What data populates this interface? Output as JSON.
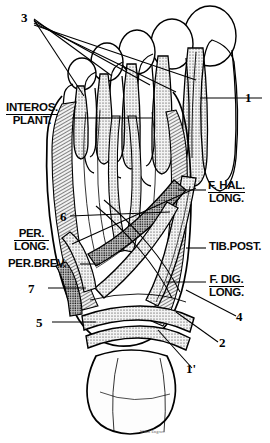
{
  "figure": {
    "view": "plantar",
    "signature": "Wood Engrav."
  },
  "labels": {
    "interosseous_plantar": {
      "line1": "INTEROS.",
      "line2": "PLANT."
    },
    "peroneus_longus": {
      "line1": "PER.",
      "line2": "LONG."
    },
    "peroneus_brevis": {
      "text": "PER.BREV."
    },
    "flexor_hallucis_longus": {
      "line1": "F. HAL.",
      "line2": "LONG."
    },
    "tibialis_posterior": {
      "text": "TIB.POST."
    },
    "flexor_digitorum_longus": {
      "line1": "F. DIG.",
      "line2": "LONG."
    }
  },
  "numbers": {
    "n1": "1",
    "n1prime": "1'",
    "n2": "2",
    "n3": "3",
    "n4": "4",
    "n5": "5",
    "n6": "6",
    "n7": "7"
  },
  "colors": {
    "ink": "#000000",
    "paper": "#ffffff",
    "tissue_light": "#efefef",
    "tissue_mid": "#b9b9b9",
    "tissue_dark": "#2a2a2a"
  }
}
